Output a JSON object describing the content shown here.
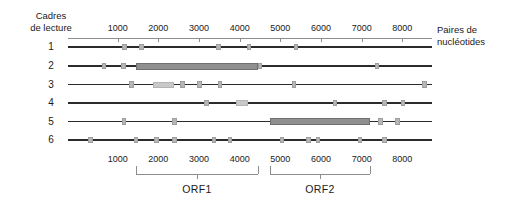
{
  "figure": {
    "frames_heading_line1": "Cadres",
    "frames_heading_line2": "de lecture",
    "axis_caption_line1": "Paires de",
    "axis_caption_line2": "nucléotides"
  },
  "axis": {
    "tick_labels": [
      "1000",
      "2000",
      "3000",
      "4000",
      "5000",
      "6000",
      "7000",
      "8000"
    ],
    "tick_values": [
      1000,
      2000,
      3000,
      4000,
      5000,
      6000,
      7000,
      8000
    ],
    "min": 0,
    "max": 8800,
    "units": "Paires de nucléotides"
  },
  "frames": [
    {
      "label": "1"
    },
    {
      "label": "2"
    },
    {
      "label": "3"
    },
    {
      "label": "4"
    },
    {
      "label": "5"
    },
    {
      "label": "6"
    }
  ],
  "orfs": [
    {
      "label": "ORF1",
      "frame": "2",
      "start": 1450,
      "end": 4450
    },
    {
      "label": "ORF2",
      "frame": "5",
      "start": 4750,
      "end": 7200
    }
  ],
  "chart_data": {
    "type": "table",
    "title": "Cadres de lecture",
    "xlabel": "Paires de nucléotides",
    "ylabel": "Cadres de lecture",
    "xlim": [
      0,
      8800
    ],
    "xticks": [
      1000,
      2000,
      3000,
      4000,
      5000,
      6000,
      7000,
      8000
    ],
    "grid": false,
    "legend": "none",
    "series": [
      {
        "name": "1",
        "stop_codons": [
          1170,
          1590,
          3480,
          4230,
          5390
        ],
        "orf_bars": []
      },
      {
        "name": "2",
        "stop_codons": [
          670,
          1140,
          4500,
          7380
        ],
        "orf_bars": [
          {
            "name": "ORF1",
            "start": 1450,
            "end": 4450,
            "shade": "dark"
          }
        ]
      },
      {
        "name": "3",
        "stop_codons": [
          1340,
          2600,
          3010,
          3510,
          5340,
          8540
        ],
        "orf_bars": [
          {
            "name": "",
            "start": 1880,
            "end": 2380,
            "shade": "pale"
          }
        ]
      },
      {
        "name": "4",
        "stop_codons": [
          3180,
          6340,
          7560,
          8020
        ],
        "orf_bars": [
          {
            "name": "",
            "start": 3900,
            "end": 4200,
            "shade": "pale"
          }
        ]
      },
      {
        "name": "5",
        "stop_codons": [
          1160,
          2400,
          7460,
          7880
        ],
        "orf_bars": [
          {
            "name": "ORF2",
            "start": 4750,
            "end": 7200,
            "shade": "dark"
          }
        ]
      },
      {
        "name": "6",
        "stop_codons": [
          330,
          1450,
          1950,
          2400,
          3370,
          3760,
          5040,
          5690,
          5930,
          6960,
          7560
        ],
        "orf_bars": []
      }
    ]
  }
}
